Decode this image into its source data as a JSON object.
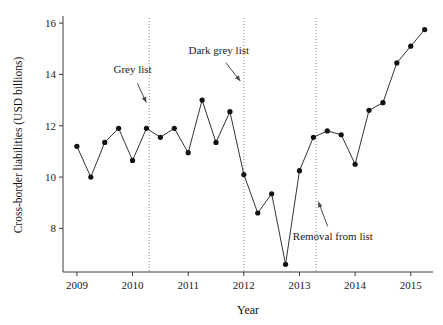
{
  "chart_data": {
    "type": "line",
    "title": "",
    "xlabel": "Year",
    "ylabel": "Cross-border liabilities (USD billions)",
    "xlim": [
      2008.75,
      2015.4
    ],
    "ylim": [
      6.3,
      16.2
    ],
    "xticks": [
      2009,
      2010,
      2011,
      2012,
      2013,
      2014,
      2015
    ],
    "xticklabels": [
      "2009",
      "2010",
      "2011",
      "2012",
      "2013",
      "2014",
      "2015"
    ],
    "yticks": [
      8,
      10,
      12,
      14,
      16
    ],
    "yticklabels": [
      "8",
      "10",
      "12",
      "14",
      "16"
    ],
    "grid": false,
    "legend": "none",
    "marker": "filled-circle",
    "line_color": "#333333",
    "marker_color": "#111111",
    "x": [
      2009.0,
      2009.25,
      2009.5,
      2009.75,
      2010.0,
      2010.25,
      2010.5,
      2010.75,
      2011.0,
      2011.25,
      2011.5,
      2011.75,
      2012.0,
      2012.25,
      2012.5,
      2012.75,
      2013.0,
      2013.25,
      2013.5,
      2013.75,
      2014.0,
      2014.25,
      2014.5,
      2014.75,
      2015.0,
      2015.25
    ],
    "values": [
      11.2,
      10.0,
      11.35,
      11.9,
      10.65,
      11.9,
      11.55,
      11.9,
      10.95,
      13.0,
      11.35,
      12.55,
      10.1,
      8.6,
      9.35,
      6.6,
      10.25,
      11.55,
      11.8,
      11.65,
      10.5,
      12.6,
      12.9,
      14.45,
      15.1,
      15.75
    ],
    "annotations": [
      {
        "label": "Grey list",
        "text_x": 2010.0,
        "text_y": 14.05,
        "arrow_to_x": 2010.27,
        "arrow_to_y": 12.8
      },
      {
        "label": "Dark grey list",
        "text_x": 2011.55,
        "text_y": 14.8,
        "arrow_to_x": 2011.97,
        "arrow_to_y": 13.65
      },
      {
        "label": "Removal from list",
        "text_x": 2013.6,
        "text_y": 7.55,
        "arrow_to_x": 2013.32,
        "arrow_to_y": 9.15
      }
    ],
    "vlines": [
      {
        "x": 2010.3,
        "label": "Grey list"
      },
      {
        "x": 2012.0,
        "label": "Dark grey list"
      },
      {
        "x": 2013.3,
        "label": "Removal from list"
      }
    ]
  }
}
